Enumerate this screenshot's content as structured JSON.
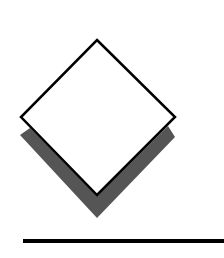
{
  "graphic": {
    "description": "diamond-with-shadow-over-line",
    "colors": {
      "background": "#ffffff",
      "diamond_fill": "#ffffff",
      "outline": "#000000",
      "shadow": "#555555"
    }
  }
}
